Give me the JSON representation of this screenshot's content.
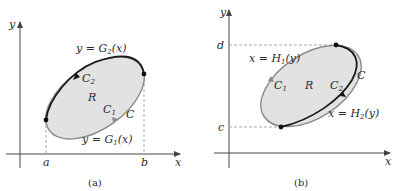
{
  "colors": {
    "fill": "#e2e2e2",
    "dark_curve": "#1a1a1a",
    "light_curve": "#8a8a8a",
    "axis": "#444444",
    "dashed": "#aaaaaa"
  },
  "panel_a": {
    "caption": "(a)",
    "y_axis": "y",
    "x_axis": "x",
    "tick_a": "a",
    "tick_b": "b",
    "upper_curve": "y = G",
    "upper_curve_sub": "2",
    "upper_curve_arg": "(x)",
    "lower_curve": "y = G",
    "lower_curve_sub": "1",
    "lower_curve_arg": "(x)",
    "c2": "C",
    "c2_sub": "2",
    "c1": "C",
    "c1_sub": "1",
    "region": "R",
    "boundary": "C"
  },
  "panel_b": {
    "caption": "(b)",
    "y_axis": "y",
    "x_axis": "x",
    "tick_c": "c",
    "tick_d": "d",
    "left_curve": "x = H",
    "left_curve_sub": "1",
    "left_curve_arg": "(y)",
    "right_curve": "x = H",
    "right_curve_sub": "2",
    "right_curve_arg": "(y)",
    "c1": "C",
    "c1_sub": "1",
    "c2": "C",
    "c2_sub": "2",
    "region": "R",
    "boundary": "C"
  }
}
